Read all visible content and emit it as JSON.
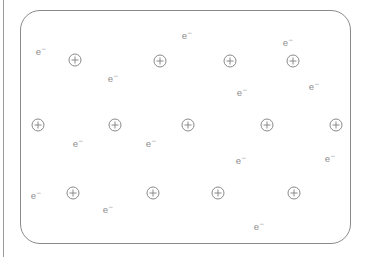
{
  "diagram": {
    "colors": {
      "stroke": "#8a8a8a",
      "text": "#8c8c8c",
      "background": "#ffffff"
    },
    "ion_symbol": "plus-in-circle",
    "electron_label": "e",
    "electron_charge": "−",
    "ions": [
      {
        "x": 75,
        "y": 60
      },
      {
        "x": 160,
        "y": 61
      },
      {
        "x": 230,
        "y": 61
      },
      {
        "x": 293,
        "y": 61
      },
      {
        "x": 38,
        "y": 125
      },
      {
        "x": 115,
        "y": 125
      },
      {
        "x": 188,
        "y": 125
      },
      {
        "x": 267,
        "y": 125
      },
      {
        "x": 336,
        "y": 125
      },
      {
        "x": 73,
        "y": 193
      },
      {
        "x": 153,
        "y": 193
      },
      {
        "x": 218,
        "y": 193
      },
      {
        "x": 294,
        "y": 193
      }
    ],
    "electrons": [
      {
        "x": 41,
        "y": 51
      },
      {
        "x": 113,
        "y": 78
      },
      {
        "x": 187,
        "y": 35
      },
      {
        "x": 242,
        "y": 92
      },
      {
        "x": 288,
        "y": 42
      },
      {
        "x": 314,
        "y": 86
      },
      {
        "x": 78,
        "y": 143
      },
      {
        "x": 151,
        "y": 143
      },
      {
        "x": 241,
        "y": 160
      },
      {
        "x": 330,
        "y": 158
      },
      {
        "x": 36,
        "y": 195
      },
      {
        "x": 108,
        "y": 209
      },
      {
        "x": 259,
        "y": 226
      }
    ]
  }
}
